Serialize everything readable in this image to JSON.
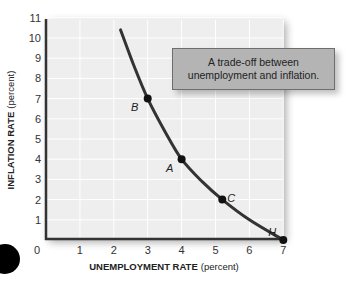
{
  "chart_data": {
    "type": "line",
    "title": "",
    "xlabel": "UNEMPLOYMENT RATE",
    "xlabel_unit": "(percent)",
    "ylabel": "INFLATION RATE",
    "ylabel_unit": "(percent)",
    "xlim": [
      0,
      7
    ],
    "ylim": [
      0,
      11
    ],
    "x_ticks": [
      "0",
      "1",
      "2",
      "3",
      "4",
      "5",
      "6",
      "7"
    ],
    "y_ticks": [
      "1",
      "2",
      "3",
      "4",
      "5",
      "6",
      "7",
      "8",
      "9",
      "10",
      "11"
    ],
    "grid": true,
    "series": [
      {
        "name": "Phillips curve",
        "x": [
          2.2,
          2.6,
          3.0,
          3.5,
          4.0,
          4.6,
          5.2,
          6.0,
          7.0
        ],
        "y": [
          10.4,
          8.6,
          7.0,
          5.4,
          4.0,
          2.9,
          2.0,
          1.0,
          0.0
        ]
      }
    ],
    "points": [
      {
        "label": "B",
        "x": 3.0,
        "y": 7.0
      },
      {
        "label": "A",
        "x": 4.0,
        "y": 4.0
      },
      {
        "label": "C",
        "x": 5.2,
        "y": 2.0
      },
      {
        "label": "H",
        "x": 7.0,
        "y": 0.0
      }
    ],
    "annotation": {
      "line1": "A trade-off between",
      "line2": "unemployment and inflation."
    }
  },
  "colors": {
    "plot_bg": "#eeeeee",
    "curve": "#333333",
    "callout_bg": "#b4b4b4",
    "axis": "#333333"
  }
}
